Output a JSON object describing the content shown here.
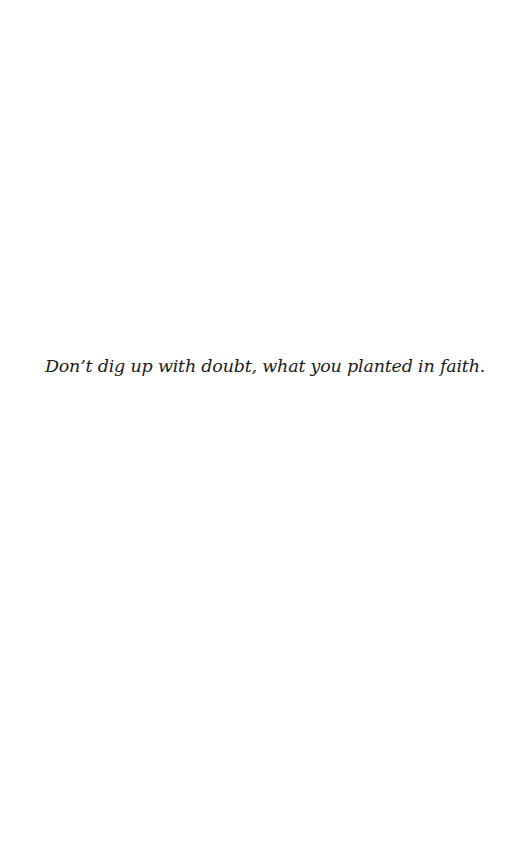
{
  "page": {
    "background": "#ffffff",
    "quote": "Don’t dig up with doubt, what you planted in faith.",
    "text_color": "#1a1a1a"
  }
}
